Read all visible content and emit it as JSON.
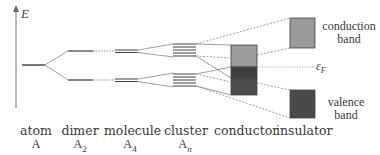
{
  "axis": {
    "label": "E"
  },
  "stages": [
    {
      "name": "atom",
      "formula": "A",
      "subscript": ""
    },
    {
      "name": "dimer",
      "formula": "A",
      "subscript": "2"
    },
    {
      "name": "molecule",
      "formula": "A",
      "subscript": "4"
    },
    {
      "name": "cluster",
      "formula": "A",
      "subscript": "n"
    },
    {
      "name": "conductor",
      "formula": "",
      "subscript": ""
    },
    {
      "name": "insulator",
      "formula": "",
      "subscript": ""
    }
  ],
  "bands": {
    "conduction": {
      "line1": "conduction",
      "line2": "band",
      "color": "#9a9a9a"
    },
    "valence": {
      "line1": "valence",
      "line2": "band",
      "color": "#4a4a4a"
    }
  },
  "fermi": {
    "symbol": "ε",
    "subscript": "F"
  },
  "colors": {
    "line": "#555555",
    "light_box": "#9c9c9c",
    "dark_box": "#4b4b4b",
    "mid_box": "#3a3a3a"
  }
}
